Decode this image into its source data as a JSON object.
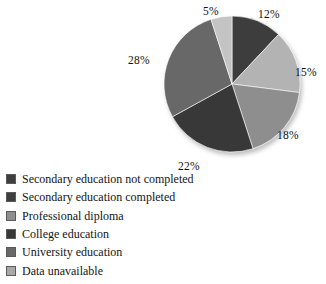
{
  "chart_data": {
    "type": "pie",
    "title": "",
    "subtitle": "",
    "xlabel": "",
    "ylabel": "",
    "legend_position": "bottom-left",
    "grid": false,
    "units": "percent",
    "start_angle_deg": 0,
    "direction": "clockwise",
    "categories": [
      "Secondary education not completed",
      "Secondary education completed",
      "Professional diploma",
      "College education",
      "University education",
      "Data unavailable"
    ],
    "values": [
      12,
      15,
      18,
      22,
      28,
      5
    ],
    "data_labels": [
      "12%",
      "15%",
      "18%",
      "22%",
      "28%",
      "5%"
    ],
    "colors": [
      "#3e3e3e",
      "#b3b3b3",
      "#8e8e8e",
      "#383838",
      "#686868",
      "#c4c4c4"
    ],
    "slices": [
      {
        "label": "Secondary education not completed",
        "value": 12,
        "display": "12%",
        "color": "#3e3e3e"
      },
      {
        "label": "Secondary education completed",
        "value": 15,
        "display": "15%",
        "color": "#b3b3b3"
      },
      {
        "label": "Professional diploma",
        "value": 18,
        "display": "18%",
        "color": "#8e8e8e"
      },
      {
        "label": "College education",
        "value": 22,
        "display": "22%",
        "color": "#383838"
      },
      {
        "label": "University education",
        "value": 28,
        "display": "28%",
        "color": "#686868"
      },
      {
        "label": "Data unavailable",
        "value": 5,
        "display": "5%",
        "color": "#c4c4c4"
      }
    ]
  },
  "pie": {
    "center_x": 232,
    "center_y": 84,
    "radius": 68,
    "labels": [
      {
        "text": "12%",
        "x": 258,
        "y": 8
      },
      {
        "text": "15%",
        "x": 295,
        "y": 66
      },
      {
        "text": "18%",
        "x": 277,
        "y": 129
      },
      {
        "text": "22%",
        "x": 178,
        "y": 160
      },
      {
        "text": "28%",
        "x": 128,
        "y": 54
      },
      {
        "text": "5%",
        "x": 203,
        "y": 5
      }
    ]
  },
  "legend": {
    "items": [
      {
        "label": "Secondary education not completed",
        "color": "#3e3e3e"
      },
      {
        "label": "Secondary education completed",
        "color": "#3e3e3e"
      },
      {
        "label": "Professional diploma",
        "color": "#8e8e8e"
      },
      {
        "label": "College education",
        "color": "#383838"
      },
      {
        "label": "University education",
        "color": "#686868"
      },
      {
        "label": "Data unavailable",
        "color": "#a8a8a8"
      }
    ]
  }
}
